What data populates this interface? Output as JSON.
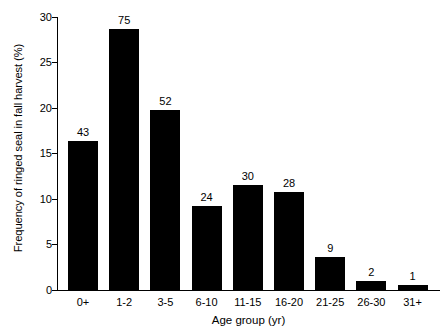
{
  "chart_data": {
    "type": "bar",
    "title": "",
    "subtitle": "",
    "xlabel": "Age group (yr)",
    "ylabel": "Frequency of ringed seal in fall harvest (%)",
    "categories": [
      "0+",
      "1-2",
      "3-5",
      "6-10",
      "11-15",
      "16-20",
      "21-25",
      "26-30",
      "31+"
    ],
    "values": [
      16.4,
      28.7,
      19.8,
      9.2,
      11.5,
      10.8,
      3.6,
      1.0,
      0.6
    ],
    "bar_labels": [
      "43",
      "75",
      "52",
      "24",
      "30",
      "28",
      "9",
      "2",
      "1"
    ],
    "bar_label_meaning": "sample size (n) above each bar",
    "ylim": [
      0,
      30
    ],
    "yticks": [
      0,
      5,
      10,
      15,
      20,
      25,
      30
    ],
    "ytick_labels": [
      "0",
      "5",
      "10",
      "15",
      "20",
      "25",
      "30"
    ],
    "grid": false,
    "legend": null,
    "legend_position": "none",
    "bar_color": "#000000",
    "background_color": "#ffffff",
    "axis_color": "#000000"
  }
}
